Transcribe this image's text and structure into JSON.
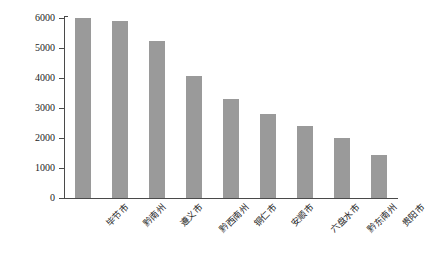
{
  "chart_data": {
    "type": "bar",
    "title": "",
    "xlabel": "",
    "ylabel": "灌丛生态系统面积/km²",
    "categories": [
      "毕节市",
      "黔南州",
      "遵义市",
      "黔西南州",
      "铜仁市",
      "安顺市",
      "六盘水市",
      "黔东南州",
      "贵阳市"
    ],
    "values": [
      6000,
      5900,
      5230,
      4080,
      3310,
      2790,
      2410,
      1990,
      1430
    ],
    "ylim": [
      0,
      6000
    ],
    "yticks": [
      0,
      1000,
      2000,
      3000,
      4000,
      5000,
      6000
    ],
    "ytick_labels": [
      "0",
      "1000",
      "2000",
      "3000",
      "4000",
      "5000",
      "6000"
    ],
    "grid": false,
    "legend": null,
    "bar_color": "#9a9a9a",
    "axis_color": "#4a4a4a"
  }
}
